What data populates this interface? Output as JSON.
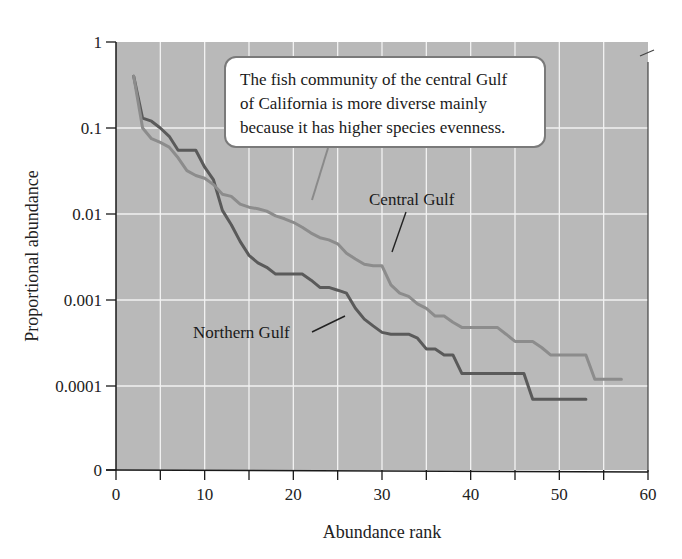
{
  "chart_data": {
    "type": "line",
    "title": "",
    "xlabel": "Abundance rank",
    "ylabel": "Proportional abundance",
    "xlim": [
      0,
      60
    ],
    "y_scale": "log",
    "x_ticks": [
      0,
      10,
      20,
      30,
      40,
      50,
      60
    ],
    "x_minor_ticks": [
      5,
      15,
      25,
      35,
      45,
      55
    ],
    "y_ticks": [
      "1",
      "0.1",
      "0.01",
      "0.001",
      "0.0001",
      "0"
    ],
    "grid": true,
    "legend": "none (direct labels)",
    "series": [
      {
        "name": "Northern Gulf",
        "color": "#5a5a5a",
        "points": [
          [
            2,
            0.4
          ],
          [
            3,
            0.13
          ],
          [
            4,
            0.12
          ],
          [
            5,
            0.1
          ],
          [
            6,
            0.08
          ],
          [
            7,
            0.055
          ],
          [
            8,
            0.055
          ],
          [
            9,
            0.055
          ],
          [
            10,
            0.035
          ],
          [
            11,
            0.025
          ],
          [
            12,
            0.011
          ],
          [
            13,
            0.0075
          ],
          [
            14,
            0.0048
          ],
          [
            15,
            0.0033
          ],
          [
            16,
            0.0027
          ],
          [
            17,
            0.0024
          ],
          [
            18,
            0.002
          ],
          [
            19,
            0.002
          ],
          [
            20,
            0.002
          ],
          [
            21,
            0.002
          ],
          [
            22,
            0.0017
          ],
          [
            23,
            0.0014
          ],
          [
            24,
            0.0014
          ],
          [
            25,
            0.0013
          ],
          [
            26,
            0.0012
          ],
          [
            27,
            0.0008
          ],
          [
            28,
            0.0006
          ],
          [
            29,
            0.0005
          ],
          [
            30,
            0.00042
          ],
          [
            31,
            0.0004
          ],
          [
            32,
            0.0004
          ],
          [
            33,
            0.0004
          ],
          [
            34,
            0.00036
          ],
          [
            35,
            0.00027
          ],
          [
            36,
            0.00027
          ],
          [
            37,
            0.00023
          ],
          [
            38,
            0.00023
          ],
          [
            39,
            0.00014
          ],
          [
            40,
            0.00014
          ],
          [
            41,
            0.00014
          ],
          [
            42,
            0.00014
          ],
          [
            43,
            0.00014
          ],
          [
            44,
            0.00014
          ],
          [
            45,
            0.00014
          ],
          [
            46,
            0.00014
          ],
          [
            47,
            7e-05
          ],
          [
            48,
            7e-05
          ],
          [
            49,
            7e-05
          ],
          [
            50,
            7e-05
          ],
          [
            51,
            7e-05
          ],
          [
            52,
            7e-05
          ],
          [
            53,
            7e-05
          ]
        ]
      },
      {
        "name": "Central Gulf",
        "color": "#8c8c8c",
        "points": [
          [
            2,
            0.4
          ],
          [
            3,
            0.1
          ],
          [
            4,
            0.075
          ],
          [
            5,
            0.068
          ],
          [
            6,
            0.06
          ],
          [
            7,
            0.045
          ],
          [
            8,
            0.032
          ],
          [
            9,
            0.028
          ],
          [
            10,
            0.026
          ],
          [
            11,
            0.022
          ],
          [
            12,
            0.017
          ],
          [
            13,
            0.016
          ],
          [
            14,
            0.013
          ],
          [
            15,
            0.012
          ],
          [
            16,
            0.0115
          ],
          [
            17,
            0.0108
          ],
          [
            18,
            0.0095
          ],
          [
            19,
            0.0088
          ],
          [
            20,
            0.008
          ],
          [
            21,
            0.007
          ],
          [
            22,
            0.006
          ],
          [
            23,
            0.0053
          ],
          [
            24,
            0.005
          ],
          [
            25,
            0.0045
          ],
          [
            26,
            0.0035
          ],
          [
            27,
            0.003
          ],
          [
            28,
            0.0026
          ],
          [
            29,
            0.0025
          ],
          [
            30,
            0.0025
          ],
          [
            31,
            0.0015
          ],
          [
            32,
            0.0012
          ],
          [
            33,
            0.0011
          ],
          [
            34,
            0.0009
          ],
          [
            35,
            0.0008
          ],
          [
            36,
            0.00065
          ],
          [
            37,
            0.00065
          ],
          [
            38,
            0.00055
          ],
          [
            39,
            0.00048
          ],
          [
            40,
            0.00048
          ],
          [
            41,
            0.00048
          ],
          [
            42,
            0.00048
          ],
          [
            43,
            0.00048
          ],
          [
            44,
            0.0004
          ],
          [
            45,
            0.00033
          ],
          [
            46,
            0.00033
          ],
          [
            47,
            0.00033
          ],
          [
            48,
            0.00028
          ],
          [
            49,
            0.00023
          ],
          [
            50,
            0.00023
          ],
          [
            51,
            0.00023
          ],
          [
            52,
            0.00023
          ],
          [
            53,
            0.00023
          ],
          [
            54,
            0.00012
          ],
          [
            55,
            0.00012
          ],
          [
            56,
            0.00012
          ],
          [
            57,
            0.00012
          ]
        ]
      }
    ],
    "annotations": [
      {
        "text": "The fish community of the central Gulf of California is more diverse mainly because it has higher species evenness.",
        "type": "callout-box"
      },
      {
        "text": "Central Gulf",
        "type": "series-label"
      },
      {
        "text": "Northern Gulf",
        "type": "series-label"
      }
    ]
  },
  "labels": {
    "xlabel": "Abundance rank",
    "ylabel": "Proportional abundance",
    "central": "Central Gulf",
    "northern": "Northern Gulf",
    "callout_lines": [
      "The fish community of the central Gulf",
      "of California is more diverse mainly",
      "because it has higher species evenness."
    ]
  },
  "colors": {
    "plot_bg": "#b9b9b9",
    "grid": "#f2f2f2",
    "axis": "#1a1a1a",
    "northern": "#5a5a5a",
    "central": "#8c8c8c"
  }
}
